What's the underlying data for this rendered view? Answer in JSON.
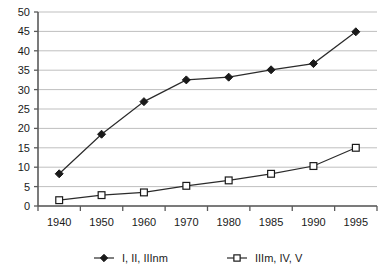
{
  "chart_data": {
    "type": "line",
    "title": "",
    "xlabel": "",
    "ylabel": "",
    "categories": [
      "1940",
      "1950",
      "1960",
      "1970",
      "1980",
      "1985",
      "1990",
      "1995"
    ],
    "x": [
      1940,
      1950,
      1960,
      1970,
      1980,
      1985,
      1990,
      1995
    ],
    "series": [
      {
        "name": "I, II, IIInm",
        "marker": "filled-diamond",
        "color": "#1a1a1a",
        "values": [
          8.3,
          18.5,
          26.9,
          32.5,
          33.2,
          35.1,
          36.7,
          44.9
        ]
      },
      {
        "name": "IIIm, IV, V",
        "marker": "open-square",
        "color": "#1a1a1a",
        "values": [
          1.5,
          2.8,
          3.5,
          5.2,
          6.6,
          8.3,
          10.3,
          15.0
        ]
      }
    ],
    "ylim": [
      0,
      50
    ],
    "yticks": [
      0,
      5,
      10,
      15,
      20,
      25,
      30,
      35,
      40,
      45,
      50
    ],
    "ytick_labels": [
      "0",
      "5",
      "10",
      "15",
      "20",
      "25",
      "30",
      "35",
      "40",
      "45",
      "50"
    ],
    "grid": true,
    "grid_axis": "y",
    "legend_position": "bottom",
    "colors": {
      "gridline": "#bfbfbf",
      "axis": "#5a5a5a",
      "line": "#2b2b2b",
      "text": "#1a1a1a",
      "background": "#ffffff"
    }
  },
  "legend": {
    "entries": [
      {
        "label": "I, II, IIInm",
        "marker": "filled-diamond"
      },
      {
        "label": "IIIm, IV, V",
        "marker": "open-square"
      }
    ]
  }
}
